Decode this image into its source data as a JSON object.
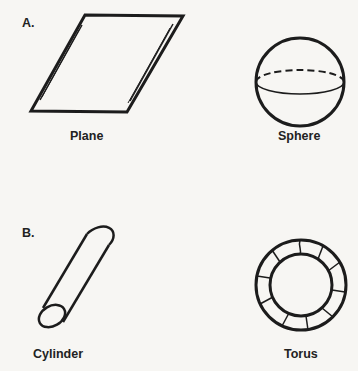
{
  "sections": [
    {
      "marker": "A.",
      "shapes": [
        {
          "name": "Plane"
        },
        {
          "name": "Sphere"
        }
      ]
    },
    {
      "marker": "B.",
      "shapes": [
        {
          "name": "Cylinder"
        },
        {
          "name": "Torus"
        }
      ]
    }
  ],
  "colors": {
    "stroke": "#1c1c1c",
    "background": "#f7f6f3"
  }
}
